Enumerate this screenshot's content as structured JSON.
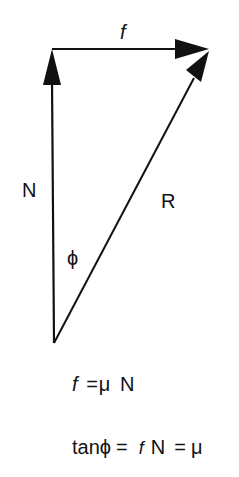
{
  "figure": {
    "colors": {
      "ink": "#111111",
      "background": "#ffffff"
    },
    "vectors": [
      {
        "id": "N",
        "name": "normal-force",
        "from": [
          54,
          343
        ],
        "to": [
          52,
          49
        ],
        "label": "N"
      },
      {
        "id": "f",
        "name": "friction-force",
        "from": [
          52,
          49
        ],
        "to": [
          209,
          49
        ],
        "label": "f"
      },
      {
        "id": "R",
        "name": "resultant-force",
        "from": [
          54,
          343
        ],
        "to": [
          209,
          51
        ],
        "label": "R"
      }
    ],
    "labels": {
      "f": "f",
      "N": "N",
      "R": "R",
      "phi": "ϕ"
    }
  },
  "equations": {
    "eq1": {
      "lhs": "f",
      "equals": "=",
      "rhs_mu": "μ",
      "rhs_N": "N"
    },
    "eq2": {
      "lhs": "tanϕ",
      "equals1": "=",
      "frac_num": "f",
      "frac_den": "N",
      "equals2": "=",
      "rhs": "μ"
    }
  }
}
